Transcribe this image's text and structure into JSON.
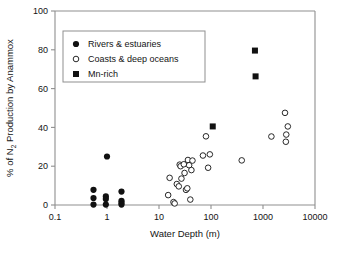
{
  "chart_data": {
    "type": "scatter",
    "title": "",
    "xlabel": "Water Depth (m)",
    "ylabel_parts": {
      "pre": "% of N",
      "sub": "2",
      "post": " Production by Anammox"
    },
    "ylabel": "% of N2 Production by Anammox",
    "xscale": "log",
    "yscale": "linear",
    "xlim": [
      0.1,
      10000
    ],
    "ylim": [
      0,
      100
    ],
    "xticks": [
      0.1,
      1,
      10,
      100,
      1000,
      10000
    ],
    "xtick_labels": [
      "0.1",
      "1",
      "10",
      "100",
      "1000",
      "10000"
    ],
    "yticks": [
      0,
      20,
      40,
      60,
      80,
      100
    ],
    "ytick_labels": [
      "0",
      "20",
      "40",
      "60",
      "80",
      "100"
    ],
    "grid": false,
    "legend_position": "upper-left-inside",
    "series": [
      {
        "name": "Rivers & estuaries",
        "marker": "filled-circle",
        "color": "#111111",
        "points": [
          [
            0.55,
            7.8
          ],
          [
            0.55,
            3.6
          ],
          [
            0.55,
            0.2
          ],
          [
            0.95,
            4.4
          ],
          [
            0.95,
            3.1
          ],
          [
            0.95,
            0.2
          ],
          [
            1.9,
            6.9
          ],
          [
            1.9,
            2.2
          ],
          [
            1.9,
            1.2
          ],
          [
            1.9,
            0.2
          ],
          [
            1.0,
            25.0
          ]
        ]
      },
      {
        "name": "Coasts & deep oceans",
        "marker": "open-circle",
        "color": "#111111",
        "points": [
          [
            15.0,
            5.1
          ],
          [
            16.0,
            14.0
          ],
          [
            19.0,
            1.5
          ],
          [
            20.0,
            0.8
          ],
          [
            22.0,
            10.8
          ],
          [
            24.0,
            9.6
          ],
          [
            25.0,
            20.8
          ],
          [
            26.0,
            20.0
          ],
          [
            27.0,
            13.6
          ],
          [
            30.0,
            21.0
          ],
          [
            31.0,
            16.5
          ],
          [
            33.0,
            7.8
          ],
          [
            35.0,
            8.6
          ],
          [
            36.0,
            23.2
          ],
          [
            38.0,
            20.5
          ],
          [
            40.0,
            2.8
          ],
          [
            42.0,
            18.0
          ],
          [
            44.0,
            22.9
          ],
          [
            70.0,
            25.5
          ],
          [
            80.0,
            35.4
          ],
          [
            88.0,
            19.2
          ],
          [
            95.0,
            26.1
          ],
          [
            390.0,
            23.0
          ],
          [
            1450.0,
            35.3
          ],
          [
            2650.0,
            47.5
          ],
          [
            2750.0,
            32.6
          ],
          [
            2800.0,
            36.3
          ],
          [
            3000.0,
            40.5
          ]
        ]
      },
      {
        "name": "Mn-rich",
        "marker": "filled-square",
        "color": "#111111",
        "points": [
          [
            108.0,
            40.5
          ],
          [
            700.0,
            79.6
          ],
          [
            720.0,
            66.3
          ]
        ]
      }
    ]
  },
  "legend": {
    "entries": [
      {
        "label": "Rivers & estuaries",
        "marker": "filled-circle"
      },
      {
        "label": "Coasts & deep oceans",
        "marker": "open-circle"
      },
      {
        "label": "Mn-rich",
        "marker": "filled-square"
      }
    ]
  }
}
